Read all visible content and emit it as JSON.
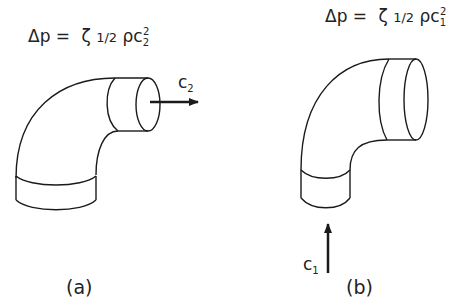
{
  "diagram": {
    "panel_a": {
      "formula": {
        "lhs": "Δp",
        "eq": "=",
        "zeta": "ζ",
        "half": "1/2",
        "rho": "ρ",
        "c": "c",
        "c_sub": "2",
        "c_sup": "2"
      },
      "velocity_label": {
        "c": "c",
        "sub": "2"
      },
      "flow_direction": "outlet-right",
      "caption": "(a)"
    },
    "panel_b": {
      "formula": {
        "lhs": "Δp",
        "eq": "=",
        "zeta": "ζ",
        "half": "1/2",
        "rho": "ρ",
        "c": "c",
        "c_sub": "1",
        "c_sup": "2"
      },
      "velocity_label": {
        "c": "c",
        "sub": "1"
      },
      "flow_direction": "inlet-up",
      "caption": "(b)"
    },
    "colors": {
      "stroke": "#1a1a1a",
      "background": "#ffffff"
    }
  }
}
